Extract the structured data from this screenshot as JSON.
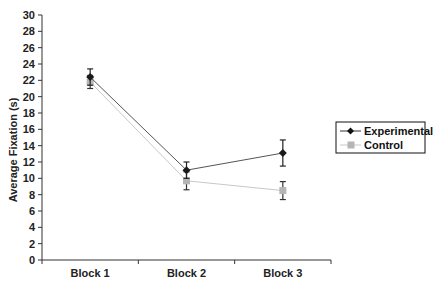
{
  "chart_data": {
    "type": "line",
    "title": "",
    "xlabel": "",
    "ylabel": "Average Fixation (s)",
    "categories": [
      "Block 1",
      "Block 2",
      "Block 3"
    ],
    "ylim": [
      0,
      30
    ],
    "yticks": [
      0,
      2,
      4,
      6,
      8,
      10,
      12,
      14,
      16,
      18,
      20,
      22,
      24,
      26,
      28,
      30
    ],
    "grid": false,
    "legend_position": "right",
    "series": [
      {
        "name": "Experimental",
        "values": [
          22.4,
          11.0,
          13.1
        ],
        "errors": [
          1.0,
          1.0,
          1.6
        ],
        "color": "#1a1a1a",
        "line_color": "#555555",
        "marker": "diamond"
      },
      {
        "name": "Control",
        "values": [
          21.8,
          9.7,
          8.5
        ],
        "errors": [
          0.8,
          1.1,
          1.1
        ],
        "color": "#b5b5b5",
        "line_color": "#c8c8c8",
        "marker": "square"
      }
    ]
  },
  "legend": {
    "items": [
      {
        "label": "Experimental"
      },
      {
        "label": "Control"
      }
    ]
  }
}
